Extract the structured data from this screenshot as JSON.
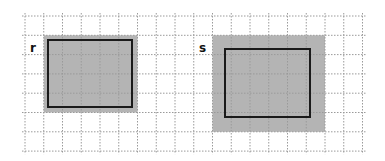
{
  "diagram": {
    "grid": {
      "x0": 25,
      "y0": 16,
      "cols": 18,
      "rows": 7,
      "cell_w": 18.75,
      "cell_h": 19.3,
      "line_color": "#9a9a9a",
      "style": "dotted"
    },
    "shapes": [
      {
        "id": "r",
        "label": "r",
        "label_pos": [
          30,
          52
        ],
        "shaded": {
          "col": 1,
          "row": 1,
          "cols": 5,
          "rows": 4,
          "color": "#b4b4b4"
        },
        "outline": {
          "x": 48,
          "y": 40,
          "w": 84,
          "h": 67,
          "stroke": "#1a1a1a",
          "stroke_width": 2
        }
      },
      {
        "id": "s",
        "label": "s",
        "label_pos": [
          199,
          52
        ],
        "shaded": {
          "col": 10,
          "row": 1,
          "cols": 6,
          "rows": 5,
          "color": "#b4b4b4"
        },
        "outline": {
          "x": 225,
          "y": 49,
          "w": 85,
          "h": 68,
          "stroke": "#1a1a1a",
          "stroke_width": 2
        }
      }
    ]
  }
}
